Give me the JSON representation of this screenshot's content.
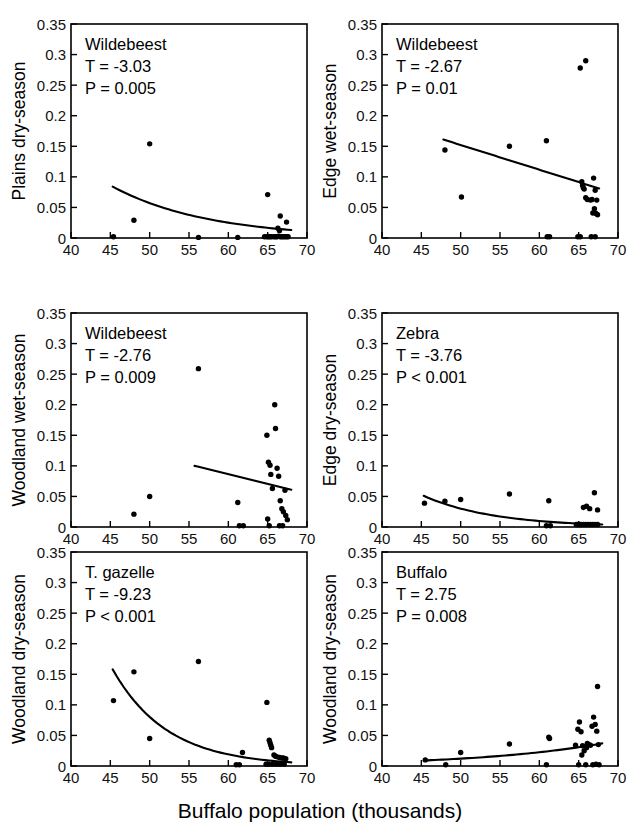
{
  "figure": {
    "x_axis_title": "Buffalo population (thousands)",
    "x_ticks": [
      "40",
      "45",
      "50",
      "55",
      "60",
      "65",
      "70"
    ],
    "y_ticks": [
      "0",
      "0.05",
      "0.1",
      "0.15",
      "0.2",
      "0.25",
      "0.3",
      "0.35"
    ],
    "xlim": [
      40,
      70
    ],
    "ylim": [
      0,
      0.35
    ],
    "point_color": "#000000",
    "line_color": "#000000",
    "background": "#ffffff"
  },
  "chart_data": [
    {
      "type": "scatter",
      "panel_id": "plains-dry-season-wildebeest",
      "title": "",
      "species_label": "Wildebeest",
      "t_label": "T = -3.03",
      "p_label": "P = 0.005",
      "xlabel": "Buffalo population (thousands)",
      "ylabel": "Plains dry-season",
      "xlim": [
        40,
        70
      ],
      "ylim": [
        0,
        0.35
      ],
      "grid": false,
      "legend": "none",
      "x": [
        45.4,
        48.0,
        50.0,
        56.2,
        61.2,
        64.6,
        64.9,
        65.1,
        65.3,
        65.5,
        65.8,
        66.0,
        66.2,
        66.4,
        66.5,
        66.6,
        66.8,
        67.0,
        67.2,
        67.4,
        67.6,
        65.0,
        66.3,
        66.6,
        67.4
      ],
      "y": [
        0.002,
        0.029,
        0.154,
        0.001,
        0.001,
        0.002,
        0.002,
        0.002,
        0.002,
        0.002,
        0.002,
        0.002,
        0.002,
        0.003,
        0.012,
        0.002,
        0.002,
        0.002,
        0.002,
        0.002,
        0.002,
        0.071,
        0.016,
        0.036,
        0.026
      ],
      "fit_curve": {
        "shape": "exponential-decay",
        "x_start": 45.3,
        "x_end": 68.0,
        "y_start": 0.084,
        "y_end": 0.013
      }
    },
    {
      "type": "scatter",
      "panel_id": "edge-wet-season-wildebeest",
      "title": "",
      "species_label": "Wildebeest",
      "t_label": "T = -2.67",
      "p_label": "P = 0.01",
      "xlabel": "Buffalo population (thousands)",
      "ylabel": "Edge wet-season",
      "xlim": [
        40,
        70
      ],
      "ylim": [
        0,
        0.35
      ],
      "grid": false,
      "legend": "none",
      "x": [
        48.0,
        50.1,
        56.2,
        60.9,
        65.2,
        65.9,
        61.0,
        61.3,
        64.9,
        65.2,
        66.6,
        67.1,
        65.4,
        65.5,
        65.6,
        65.7,
        65.9,
        66.1,
        66.5,
        66.7,
        66.9,
        67.1,
        67.3,
        67.0,
        67.2,
        67.4,
        66.8
      ],
      "y": [
        0.144,
        0.067,
        0.15,
        0.159,
        0.278,
        0.29,
        0.002,
        0.002,
        0.002,
        0.002,
        0.002,
        0.002,
        0.092,
        0.086,
        0.082,
        0.08,
        0.066,
        0.063,
        0.062,
        0.063,
        0.098,
        0.078,
        0.062,
        0.048,
        0.04,
        0.038,
        0.041
      ],
      "fit_curve": {
        "shape": "linear",
        "x_start": 47.8,
        "x_end": 67.6,
        "y_start": 0.161,
        "y_end": 0.081
      }
    },
    {
      "type": "scatter",
      "panel_id": "woodland-wet-season-wildebeest",
      "title": "",
      "species_label": "Wildebeest",
      "t_label": "T = -2.76",
      "p_label": "P = 0.009",
      "xlabel": "Buffalo population (thousands)",
      "ylabel": "Woodland wet-season",
      "xlim": [
        40,
        70
      ],
      "ylim": [
        0,
        0.35
      ],
      "grid": false,
      "legend": "none",
      "x": [
        48.0,
        50.0,
        56.2,
        61.2,
        61.4,
        61.9,
        64.9,
        65.1,
        65.3,
        65.4,
        65.6,
        65.9,
        66.0,
        66.2,
        66.4,
        66.6,
        66.8,
        67.0,
        67.2,
        67.3,
        67.5,
        65.0,
        65.2,
        66.5,
        66.9
      ],
      "y": [
        0.021,
        0.05,
        0.259,
        0.04,
        0.002,
        0.002,
        0.15,
        0.106,
        0.101,
        0.086,
        0.063,
        0.2,
        0.161,
        0.096,
        0.083,
        0.043,
        0.03,
        0.025,
        0.06,
        0.019,
        0.012,
        0.013,
        0.002,
        0.002,
        0.002
      ],
      "fit_curve": {
        "shape": "linear",
        "x_start": 55.7,
        "x_end": 68.0,
        "y_start": 0.1,
        "y_end": 0.061
      }
    },
    {
      "type": "scatter",
      "panel_id": "edge-dry-season-zebra",
      "title": "",
      "species_label": "Zebra",
      "t_label": "T = -3.76",
      "p_label": "P < 0.001",
      "xlabel": "Buffalo population (thousands)",
      "ylabel": "Edge dry-season",
      "xlim": [
        40,
        70
      ],
      "ylim": [
        0,
        0.35
      ],
      "grid": false,
      "legend": "none",
      "x": [
        45.4,
        48.0,
        50.0,
        56.2,
        61.2,
        65.6,
        66.0,
        66.4,
        67.0,
        67.4,
        60.9,
        61.4,
        64.7,
        64.9,
        65.1,
        65.3,
        65.6,
        65.9,
        66.2,
        66.5,
        66.8,
        67.1,
        67.4
      ],
      "y": [
        0.039,
        0.042,
        0.045,
        0.054,
        0.043,
        0.032,
        0.034,
        0.03,
        0.056,
        0.028,
        0.002,
        0.002,
        0.004,
        0.004,
        0.004,
        0.004,
        0.004,
        0.004,
        0.004,
        0.004,
        0.004,
        0.004,
        0.004
      ],
      "fit_curve": {
        "shape": "exponential-decay",
        "x_start": 45.3,
        "x_end": 68.0,
        "y_start": 0.051,
        "y_end": 0.004
      }
    },
    {
      "type": "scatter",
      "panel_id": "woodland-dry-season-t-gazelle",
      "title": "",
      "species_label": "T. gazelle",
      "t_label": "T = -9.23",
      "p_label": "P < 0.001",
      "xlabel": "Buffalo population (thousands)",
      "ylabel": "Woodland dry-season",
      "xlim": [
        40,
        70
      ],
      "ylim": [
        0,
        0.35
      ],
      "grid": false,
      "legend": "none",
      "x": [
        45.4,
        48.0,
        50.0,
        56.2,
        61.8,
        65.2,
        65.3,
        65.4,
        65.5,
        64.9,
        65.8,
        66.0,
        66.2,
        66.5,
        66.8,
        67.0,
        67.3,
        61.0,
        61.4,
        64.8,
        65.1,
        65.6,
        66.1,
        66.6,
        67.1
      ],
      "y": [
        0.107,
        0.154,
        0.045,
        0.171,
        0.022,
        0.042,
        0.038,
        0.034,
        0.03,
        0.104,
        0.018,
        0.016,
        0.015,
        0.014,
        0.013,
        0.013,
        0.012,
        0.002,
        0.002,
        0.003,
        0.003,
        0.003,
        0.003,
        0.003,
        0.003
      ],
      "fit_curve": {
        "shape": "exponential-decay",
        "x_start": 45.3,
        "x_end": 68.0,
        "y_start": 0.158,
        "y_end": 0.006
      }
    },
    {
      "type": "scatter",
      "panel_id": "woodland-dry-season-buffalo",
      "title": "",
      "species_label": "Buffalo",
      "t_label": "T = 2.75",
      "p_label": "P = 0.008",
      "xlabel": "Buffalo population (thousands)",
      "ylabel": "Woodland dry-season",
      "xlim": [
        40,
        70
      ],
      "ylim": [
        0,
        0.35
      ],
      "grid": false,
      "legend": "none",
      "x": [
        45.5,
        48.1,
        50.0,
        56.2,
        60.9,
        61.2,
        61.3,
        64.6,
        64.9,
        65.1,
        65.3,
        65.5,
        65.7,
        65.9,
        66.1,
        66.3,
        66.5,
        66.7,
        66.9,
        67.1,
        67.3,
        67.5,
        67.4,
        65.0,
        65.4,
        66.0,
        66.8,
        67.2,
        67.6
      ],
      "y": [
        0.01,
        0.002,
        0.022,
        0.036,
        0.002,
        0.047,
        0.045,
        0.034,
        0.06,
        0.072,
        0.056,
        0.033,
        0.025,
        0.002,
        0.037,
        0.035,
        0.034,
        0.065,
        0.08,
        0.068,
        0.057,
        0.035,
        0.13,
        0.002,
        0.018,
        0.03,
        0.002,
        0.003,
        0.002
      ],
      "fit_curve": {
        "shape": "exponential-growth",
        "x_start": 45.3,
        "x_end": 68.0,
        "y_start": 0.009,
        "y_end": 0.037
      }
    }
  ]
}
